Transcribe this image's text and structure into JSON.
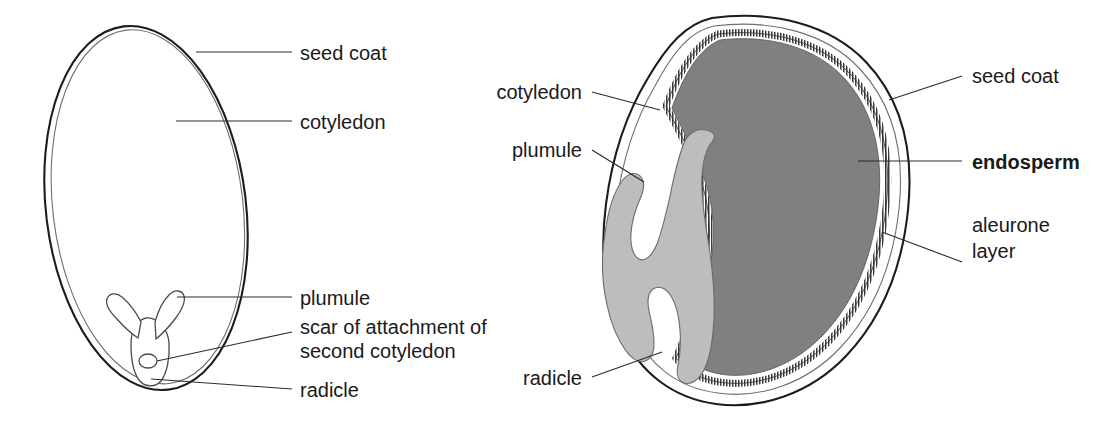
{
  "figure": {
    "background_color": "#ffffff",
    "panels": [
      {
        "id": "left-panel",
        "name": "non-endospermic-seed",
        "description": "Whole seed outline with embryo at base",
        "labels": [
          {
            "key": "seed_coat",
            "text": "seed coat"
          },
          {
            "key": "cotyledon",
            "text": "cotyledon"
          },
          {
            "key": "plumule",
            "text": "plumule"
          },
          {
            "key": "scar_line1",
            "text": "scar of attachment of"
          },
          {
            "key": "scar_line2",
            "text": "second cotyledon"
          },
          {
            "key": "radicle",
            "text": "radicle"
          }
        ]
      },
      {
        "id": "right-panel",
        "name": "endospermic-seed",
        "description": "Sectioned seed showing endosperm, aleurone layer and embryo",
        "labels": [
          {
            "key": "cotyledon",
            "text": "cotyledon"
          },
          {
            "key": "plumule",
            "text": "plumule"
          },
          {
            "key": "radicle",
            "text": "radicle"
          },
          {
            "key": "seed_coat",
            "text": "seed coat"
          },
          {
            "key": "endosperm",
            "text": "endosperm",
            "bold": true
          },
          {
            "key": "aleurone_line1",
            "text": "aleurone"
          },
          {
            "key": "aleurone_line2",
            "text": "layer"
          }
        ]
      }
    ],
    "colors": {
      "endosperm_fill": "#808080",
      "cotyledon_fill": "#bdbdbd",
      "aleurone_stripe": "#3a3a3a",
      "outline_stroke": "#1c1c1c",
      "inner_coat_stroke": "#6f6f6f",
      "leader_stroke": "#2b2b2b",
      "label_text": "#1a1a1a",
      "background": "#ffffff"
    }
  }
}
